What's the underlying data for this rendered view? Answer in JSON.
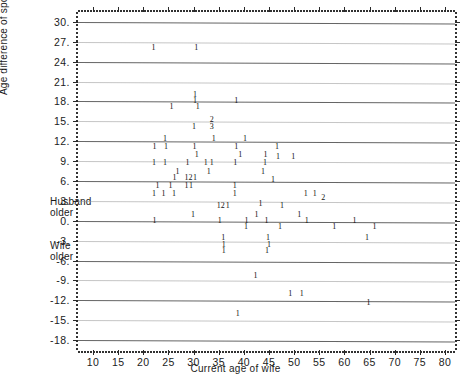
{
  "chart_data": {
    "type": "scatter",
    "title": "",
    "xlabel": "Current age of wife",
    "ylabel": "Age difference of spouses",
    "xlim": [
      7,
      82
    ],
    "ylim": [
      -19.5,
      31.5
    ],
    "xticks": [
      10,
      15,
      20,
      25,
      30,
      35,
      40,
      45,
      50,
      55,
      60,
      65,
      70,
      75,
      80
    ],
    "xticklabels": [
      "10",
      "15",
      "20",
      "25",
      "30",
      "35",
      "40",
      "45",
      "50",
      "55",
      "60",
      "65",
      "70",
      "75",
      "80"
    ],
    "yticks": [
      30,
      27,
      24,
      21,
      18,
      15,
      12,
      9,
      6,
      3,
      0,
      -3,
      -6,
      -9,
      -12,
      -15,
      -18
    ],
    "yticklabels": [
      "30.",
      "27.",
      "24.",
      "21.",
      "18.",
      "15.",
      "12.",
      "9.",
      "6.",
      "3.",
      "0.",
      "-3.",
      "-6.",
      "-9.",
      "-12.",
      "-15.",
      "-18."
    ],
    "grid": true,
    "legend": null,
    "marker_style": "count-digit",
    "annotations": [
      {
        "text": "Husband\nolder",
        "x": 5.5,
        "y": 3.0,
        "position": "left-outside"
      },
      {
        "text": "Wife\nolder",
        "x": 5.5,
        "y": -3.0,
        "position": "left-outside"
      }
    ],
    "points": [
      {
        "x": 22.0,
        "y": 26.0,
        "count": 1
      },
      {
        "x": 30.5,
        "y": 26.0,
        "count": 1
      },
      {
        "x": 30.3,
        "y": 19.0,
        "count": 1
      },
      {
        "x": 30.3,
        "y": 18.0,
        "count": 1
      },
      {
        "x": 38.5,
        "y": 18.0,
        "count": 1
      },
      {
        "x": 25.6,
        "y": 17.1,
        "count": 1
      },
      {
        "x": 30.8,
        "y": 17.1,
        "count": 1
      },
      {
        "x": 33.6,
        "y": 15.2,
        "count": 2
      },
      {
        "x": 33.6,
        "y": 14.1,
        "count": 3
      },
      {
        "x": 30.1,
        "y": 14.1,
        "count": 1
      },
      {
        "x": 24.3,
        "y": 12.4,
        "count": 1
      },
      {
        "x": 34.0,
        "y": 12.4,
        "count": 1
      },
      {
        "x": 40.2,
        "y": 12.4,
        "count": 1
      },
      {
        "x": 22.2,
        "y": 11.2,
        "count": 1
      },
      {
        "x": 24.5,
        "y": 11.2,
        "count": 1
      },
      {
        "x": 30.2,
        "y": 11.2,
        "count": 1
      },
      {
        "x": 38.5,
        "y": 11.2,
        "count": 1
      },
      {
        "x": 46.6,
        "y": 11.2,
        "count": 1
      },
      {
        "x": 30.6,
        "y": 9.9,
        "count": 1
      },
      {
        "x": 39.3,
        "y": 9.9,
        "count": 1
      },
      {
        "x": 44.3,
        "y": 9.9,
        "count": 1
      },
      {
        "x": 46.8,
        "y": 9.6,
        "count": 1
      },
      {
        "x": 49.8,
        "y": 9.6,
        "count": 1
      },
      {
        "x": 22.1,
        "y": 8.7,
        "count": 1
      },
      {
        "x": 24.3,
        "y": 8.7,
        "count": 1
      },
      {
        "x": 28.8,
        "y": 8.7,
        "count": 1
      },
      {
        "x": 32.4,
        "y": 8.7,
        "count": 1
      },
      {
        "x": 33.6,
        "y": 8.7,
        "count": 1
      },
      {
        "x": 38.3,
        "y": 8.7,
        "count": 1
      },
      {
        "x": 44.2,
        "y": 8.7,
        "count": 1
      },
      {
        "x": 26.8,
        "y": 7.4,
        "count": 1
      },
      {
        "x": 33.0,
        "y": 7.4,
        "count": 1
      },
      {
        "x": 43.8,
        "y": 7.4,
        "count": 1
      },
      {
        "x": 26.2,
        "y": 6.4,
        "count": 1
      },
      {
        "x": 28.6,
        "y": 6.4,
        "count": 1
      },
      {
        "x": 29.4,
        "y": 6.4,
        "count": 2
      },
      {
        "x": 30.3,
        "y": 6.4,
        "count": 1
      },
      {
        "x": 45.8,
        "y": 6.2,
        "count": 1
      },
      {
        "x": 22.8,
        "y": 5.2,
        "count": 1
      },
      {
        "x": 25.4,
        "y": 5.2,
        "count": 1
      },
      {
        "x": 28.6,
        "y": 5.2,
        "count": 1
      },
      {
        "x": 29.5,
        "y": 5.2,
        "count": 1
      },
      {
        "x": 38.2,
        "y": 5.2,
        "count": 1
      },
      {
        "x": 22.1,
        "y": 4.1,
        "count": 1
      },
      {
        "x": 24.0,
        "y": 4.1,
        "count": 1
      },
      {
        "x": 26.1,
        "y": 4.1,
        "count": 1
      },
      {
        "x": 38.2,
        "y": 4.1,
        "count": 1
      },
      {
        "x": 52.3,
        "y": 4.1,
        "count": 1
      },
      {
        "x": 54.1,
        "y": 4.0,
        "count": 1
      },
      {
        "x": 55.8,
        "y": 3.4,
        "count": 2
      },
      {
        "x": 43.3,
        "y": 2.5,
        "count": 1
      },
      {
        "x": 35.0,
        "y": 2.2,
        "count": 1
      },
      {
        "x": 35.8,
        "y": 2.2,
        "count": 2
      },
      {
        "x": 36.8,
        "y": 2.2,
        "count": 1
      },
      {
        "x": 47.6,
        "y": 2.2,
        "count": 1
      },
      {
        "x": 29.9,
        "y": 0.8,
        "count": 1
      },
      {
        "x": 42.5,
        "y": 0.8,
        "count": 1
      },
      {
        "x": 51.0,
        "y": 0.8,
        "count": 1
      },
      {
        "x": 22.2,
        "y": 0.0,
        "count": 1
      },
      {
        "x": 35.2,
        "y": 0.0,
        "count": 1
      },
      {
        "x": 40.5,
        "y": 0.0,
        "count": 1
      },
      {
        "x": 44.5,
        "y": 0.0,
        "count": 1
      },
      {
        "x": 52.5,
        "y": 0.0,
        "count": 1
      },
      {
        "x": 62.0,
        "y": 0.0,
        "count": 1
      },
      {
        "x": 40.4,
        "y": -1.0,
        "count": 1
      },
      {
        "x": 47.2,
        "y": -1.0,
        "count": 1
      },
      {
        "x": 58.0,
        "y": -1.0,
        "count": 1
      },
      {
        "x": 66.0,
        "y": -1.0,
        "count": 1
      },
      {
        "x": 35.9,
        "y": -2.6,
        "count": 1
      },
      {
        "x": 44.8,
        "y": -2.6,
        "count": 1
      },
      {
        "x": 64.5,
        "y": -2.6,
        "count": 1
      },
      {
        "x": 36.0,
        "y": -3.6,
        "count": 1
      },
      {
        "x": 45.0,
        "y": -3.7,
        "count": 1
      },
      {
        "x": 36.0,
        "y": -4.6,
        "count": 1
      },
      {
        "x": 44.6,
        "y": -4.6,
        "count": 1
      },
      {
        "x": 42.3,
        "y": -8.3,
        "count": 1
      },
      {
        "x": 49.2,
        "y": -11.0,
        "count": 1
      },
      {
        "x": 51.5,
        "y": -11.0,
        "count": 1
      },
      {
        "x": 64.8,
        "y": -12.4,
        "count": 1
      },
      {
        "x": 38.8,
        "y": -14.0,
        "count": 1
      }
    ]
  }
}
